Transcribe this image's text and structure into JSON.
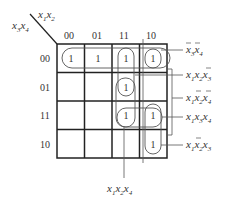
{
  "axes": {
    "col_var": [
      "x",
      "1",
      "x",
      "2"
    ],
    "row_var": [
      "x",
      "3",
      "x",
      "4"
    ],
    "col_labels": [
      "00",
      "01",
      "11",
      "10"
    ],
    "row_labels": [
      "00",
      "01",
      "11",
      "10"
    ]
  },
  "cells": {
    "r0": [
      "1",
      "1",
      "1",
      "1"
    ],
    "r1": [
      "",
      "",
      "1",
      ""
    ],
    "r2": [
      "",
      "",
      "1",
      "1"
    ],
    "r3": [
      "",
      "",
      "",
      "1"
    ]
  },
  "terms": {
    "t1": {
      "a": "x",
      "as": "3",
      "b": "x",
      "bs": "4"
    },
    "t2": {
      "a": "x",
      "as": "1",
      "b": "x",
      "bs": "2",
      "c": "x",
      "cs": "3"
    },
    "t3": {
      "a": "x",
      "as": "1",
      "b": "x",
      "bs": "2",
      "c": "x",
      "cs": "4"
    },
    "t4": {
      "a": "x",
      "as": "1",
      "b": "x",
      "bs": "3",
      "c": "x",
      "cs": "4"
    },
    "t5": {
      "a": "x",
      "as": "1",
      "b": "x",
      "bs": "2",
      "c": "x",
      "cs": "3"
    },
    "t6": {
      "a": "x",
      "as": "1",
      "b": "x",
      "bs": "2",
      "c": "x",
      "cs": "4"
    }
  },
  "colors": {
    "line": "#222222",
    "loop": "#555555",
    "text": "#333333"
  }
}
